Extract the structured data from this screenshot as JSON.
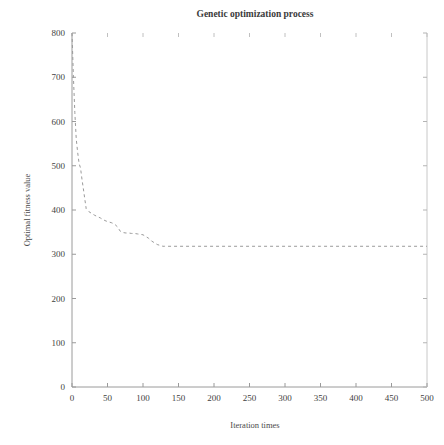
{
  "chart_data": {
    "type": "line",
    "title": "Genetic optimization process",
    "xlabel": "Iteration times",
    "ylabel": "Optimal fitness value",
    "xlim": [
      0,
      500
    ],
    "ylim": [
      0,
      800
    ],
    "xticks": [
      0,
      50,
      100,
      150,
      200,
      250,
      300,
      350,
      400,
      450,
      500
    ],
    "yticks": [
      0,
      100,
      200,
      300,
      400,
      500,
      600,
      700,
      800
    ],
    "xtick_labels": [
      "0",
      "50",
      "100",
      "150",
      "200",
      "250",
      "300",
      "350",
      "400",
      "450",
      "500"
    ],
    "ytick_labels": [
      "0",
      "100",
      "200",
      "300",
      "400",
      "500",
      "600",
      "700",
      "800"
    ],
    "grid": false,
    "legend": null,
    "line_color": "#9a9a9a",
    "line_style": "dashed",
    "line_width": 1,
    "series": [
      {
        "name": "Optimal fitness value",
        "x": [
          0,
          2,
          4,
          6,
          8,
          10,
          12,
          14,
          16,
          18,
          20,
          24,
          28,
          32,
          36,
          40,
          44,
          48,
          52,
          56,
          60,
          64,
          68,
          72,
          76,
          80,
          84,
          88,
          92,
          96,
          100,
          104,
          108,
          112,
          116,
          120,
          124,
          128,
          130,
          150,
          200,
          250,
          300,
          350,
          400,
          450,
          500
        ],
        "y": [
          800,
          700,
          620,
          560,
          530,
          505,
          495,
          470,
          448,
          425,
          403,
          396,
          392,
          388,
          385,
          382,
          378,
          375,
          373,
          371,
          368,
          362,
          352,
          349,
          348,
          348,
          347,
          347,
          346,
          345,
          344,
          340,
          336,
          330,
          326,
          322,
          320,
          318,
          318,
          318,
          318,
          318,
          318,
          318,
          318,
          318,
          318
        ]
      }
    ]
  }
}
